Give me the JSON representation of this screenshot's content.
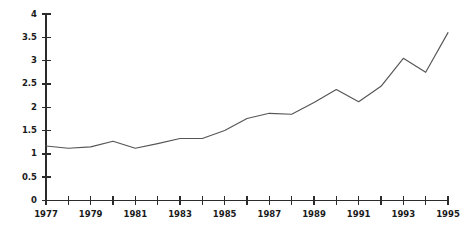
{
  "chart_data": {
    "type": "line",
    "title": "",
    "subtitle": "",
    "xlabel": "",
    "ylabel": "",
    "x": [
      1977,
      1978,
      1979,
      1980,
      1981,
      1982,
      1983,
      1984,
      1985,
      1986,
      1987,
      1988,
      1989,
      1990,
      1991,
      1992,
      1993,
      1994,
      1995
    ],
    "values": [
      1.17,
      1.12,
      1.15,
      1.27,
      1.12,
      1.22,
      1.33,
      1.33,
      1.5,
      1.76,
      1.87,
      1.85,
      2.1,
      2.38,
      2.12,
      2.45,
      3.05,
      2.75,
      3.6
    ],
    "series": [
      {
        "name": "",
        "values": [
          1.17,
          1.12,
          1.15,
          1.27,
          1.12,
          1.22,
          1.33,
          1.33,
          1.5,
          1.76,
          1.87,
          1.85,
          2.1,
          2.38,
          2.12,
          2.45,
          3.05,
          2.75,
          3.6
        ]
      }
    ],
    "xlim": [
      1977,
      1995
    ],
    "ylim": [
      0,
      4
    ],
    "yticks": [
      0,
      0.5,
      1,
      1.5,
      2,
      2.5,
      3,
      3.5,
      4
    ],
    "ytick_labels": [
      "0",
      "0.5",
      "1",
      "1.5",
      "2",
      "2.5",
      "3",
      "3.5",
      "4"
    ],
    "xticks": [
      1977,
      1978,
      1979,
      1980,
      1981,
      1982,
      1983,
      1984,
      1985,
      1986,
      1987,
      1988,
      1989,
      1990,
      1991,
      1992,
      1993,
      1994,
      1995
    ],
    "xtick_labels": [
      "1977",
      "",
      "1979",
      "",
      "1981",
      "",
      "1983",
      "",
      "1985",
      "",
      "1987",
      "",
      "1989",
      "",
      "1991",
      "",
      "1993",
      "",
      "1995"
    ],
    "grid": false,
    "legend": false,
    "legend_position": "none",
    "line_color": "#555555",
    "axis_color": "#2b2b2b",
    "background_color": "#ffffff",
    "annotations": []
  }
}
